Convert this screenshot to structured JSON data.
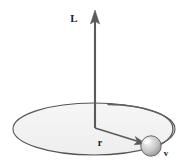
{
  "figure": {
    "kind": "physics-vector-diagram",
    "background_color": "#ffffff",
    "canvas": {
      "width": 188,
      "height": 168
    },
    "labels": {
      "angular_momentum": "L",
      "radius": "r",
      "velocity": "v"
    },
    "label_positions": {
      "angular_momentum": {
        "x": 74,
        "y": 22
      },
      "radius": {
        "x": 100,
        "y": 146
      },
      "velocity": {
        "x": 165,
        "y": 155
      }
    },
    "colors": {
      "stroke": "#4a4a4a",
      "vector_stroke": "#5a5a5a",
      "label_text": "#1b1b1b",
      "plane_fill": "#f2f2f2",
      "plane_stroke": "#555555",
      "sphere_light": "#ffffff",
      "sphere_mid": "#cfcfcf",
      "sphere_dark": "#8e8e8e",
      "sphere_edge": "#6b6b6b"
    },
    "orbit_plane": {
      "shape": "ellipse",
      "center_x": 94,
      "center_y": 129,
      "radius_x": 81,
      "radius_y": 26
    },
    "angular_momentum_vector": {
      "from": {
        "x": 95,
        "y": 128
      },
      "to": {
        "x": 95,
        "y": 12
      },
      "direction": "up",
      "arrowhead": true
    },
    "radius_vector": {
      "from": {
        "x": 95,
        "y": 128
      },
      "to": {
        "x": 143,
        "y": 143
      },
      "arrowhead": true
    },
    "velocity_arc": {
      "description": "curved tangential arrow indicating direction of motion around the orbit",
      "arrowhead": true
    },
    "particle": {
      "shape": "sphere",
      "center_x": 151,
      "center_y": 146,
      "radius": 10
    }
  }
}
